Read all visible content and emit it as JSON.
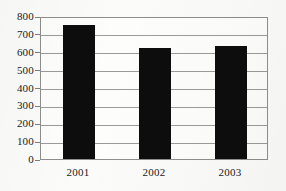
{
  "chart_data": {
    "type": "bar",
    "title": "",
    "subtitle": "",
    "xlabel": "",
    "ylabel": "",
    "categories": [
      "2001",
      "2002",
      "2003"
    ],
    "values": [
      750,
      620,
      635
    ],
    "series": [
      {
        "name": "",
        "values": [
          750,
          620,
          635
        ]
      }
    ],
    "ylim": [
      0,
      800
    ],
    "ytick_labels": [
      "800",
      "700",
      "600",
      "500",
      "400",
      "300",
      "200",
      "100",
      "0"
    ],
    "ytick_values": [
      800,
      700,
      600,
      500,
      400,
      300,
      200,
      100,
      0
    ],
    "ytick_step": 100,
    "grid": "horizontal",
    "legend": "none",
    "bar_color": "#0d0d0d",
    "gridline_color": "#9a9a9a",
    "frame_color": "#8e8e8e",
    "background_color": "#fbfbf9",
    "annotations": []
  }
}
